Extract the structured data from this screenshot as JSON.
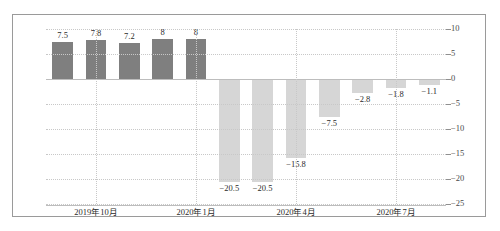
{
  "chart_data": {
    "type": "bar",
    "title": "",
    "subtitle": "",
    "xlabel": "",
    "ylabel": "",
    "ylim": [
      -25,
      10
    ],
    "ytick_values": [
      10,
      5,
      0,
      -5,
      -10,
      -15,
      -20,
      -25
    ],
    "ytick_labels": [
      "10",
      "5",
      "0",
      "−5",
      "−10",
      "−15",
      "−20",
      "−25"
    ],
    "grid": true,
    "legend": "none",
    "categories": [
      "",
      "",
      "",
      "",
      "",
      "",
      "",
      "",
      "",
      "",
      "",
      ""
    ],
    "values": [
      7.5,
      7.8,
      7.2,
      8,
      8,
      -20.5,
      -20.5,
      -15.8,
      -7.5,
      -2.8,
      -1.8,
      -1.1
    ],
    "data_labels": [
      "7.5",
      "7.8",
      "7.2",
      "8",
      "8",
      "−20.5",
      "−20.5",
      "−15.8",
      "−7.5",
      "−2.8",
      "−1.8",
      "−1.1"
    ],
    "bar_colors": [
      "#7f7f7f",
      "#7f7f7f",
      "#7f7f7f",
      "#7f7f7f",
      "#7f7f7f",
      "#d6d6d6",
      "#d6d6d6",
      "#d6d6d6",
      "#d6d6d6",
      "#d6d6d6",
      "#d6d6d6",
      "#d6d6d6"
    ],
    "xtick_labels": [
      "2019年10月",
      "2020年1月",
      "2020年4月",
      "2020年7月"
    ],
    "xtick_positions": [
      1,
      4,
      7,
      10
    ]
  },
  "axis": {
    "y_max_label": "10",
    "y_min_label": "−25"
  }
}
